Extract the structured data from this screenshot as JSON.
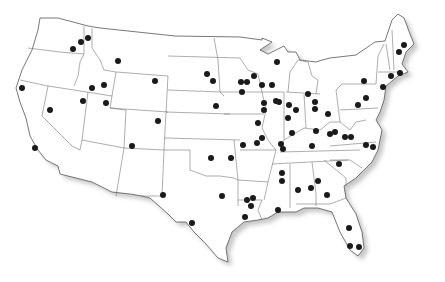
{
  "map": {
    "title": "United States locations map",
    "region": "Contiguous United States",
    "style": {
      "background": "#ffffff",
      "land_fill": "#ffffff",
      "border_color": "#6f6f6f",
      "shadow_color": "#9a9a9a",
      "marker_color": "#1a1a1a"
    },
    "marker_icon": "filled-circle-marker",
    "marker_count": 78,
    "markers": [
      {
        "region": "WA",
        "x": 73,
        "y": 49
      },
      {
        "region": "WA",
        "x": 81,
        "y": 42
      },
      {
        "region": "ID",
        "x": 88,
        "y": 38
      },
      {
        "region": "MT",
        "x": 118,
        "y": 61
      },
      {
        "region": "ID",
        "x": 92,
        "y": 88
      },
      {
        "region": "ID",
        "x": 104,
        "y": 85
      },
      {
        "region": "UT",
        "x": 83,
        "y": 101
      },
      {
        "region": "UT",
        "x": 106,
        "y": 103
      },
      {
        "region": "CA",
        "x": 22,
        "y": 88
      },
      {
        "region": "CA",
        "x": 35,
        "y": 148
      },
      {
        "region": "WY",
        "x": 155,
        "y": 81
      },
      {
        "region": "CO",
        "x": 132,
        "y": 146
      },
      {
        "region": "SD",
        "x": 207,
        "y": 74
      },
      {
        "region": "SD",
        "x": 213,
        "y": 81
      },
      {
        "region": "NE",
        "x": 216,
        "y": 106
      },
      {
        "region": "KS",
        "x": 158,
        "y": 121
      },
      {
        "region": "OK",
        "x": 211,
        "y": 158
      },
      {
        "region": "NM",
        "x": 163,
        "y": 195
      },
      {
        "region": "TX",
        "x": 192,
        "y": 223
      },
      {
        "region": "TX",
        "x": 222,
        "y": 196
      },
      {
        "region": "AR",
        "x": 253,
        "y": 198
      },
      {
        "region": "LA",
        "x": 251,
        "y": 206
      },
      {
        "region": "LA",
        "x": 245,
        "y": 217
      },
      {
        "region": "MN",
        "x": 241,
        "y": 82
      },
      {
        "region": "MN",
        "x": 247,
        "y": 82
      },
      {
        "region": "WI",
        "x": 254,
        "y": 76
      },
      {
        "region": "WI",
        "x": 262,
        "y": 85
      },
      {
        "region": "WI",
        "x": 272,
        "y": 85
      },
      {
        "region": "MI",
        "x": 277,
        "y": 62
      },
      {
        "region": "IA",
        "x": 242,
        "y": 92
      },
      {
        "region": "IL",
        "x": 264,
        "y": 103
      },
      {
        "region": "IL",
        "x": 264,
        "y": 110
      },
      {
        "region": "IL",
        "x": 276,
        "y": 101
      },
      {
        "region": "IL",
        "x": 279,
        "y": 102
      },
      {
        "region": "MO",
        "x": 258,
        "y": 123
      },
      {
        "region": "MO",
        "x": 243,
        "y": 145
      },
      {
        "region": "MO",
        "x": 257,
        "y": 143
      },
      {
        "region": "MO",
        "x": 262,
        "y": 138
      },
      {
        "region": "IN",
        "x": 289,
        "y": 105
      },
      {
        "region": "IN",
        "x": 296,
        "y": 110
      },
      {
        "region": "MI",
        "x": 308,
        "y": 94
      },
      {
        "region": "OH",
        "x": 315,
        "y": 102
      },
      {
        "region": "OH",
        "x": 315,
        "y": 109
      },
      {
        "region": "OH",
        "x": 328,
        "y": 114
      },
      {
        "region": "KY",
        "x": 292,
        "y": 133
      },
      {
        "region": "KY",
        "x": 281,
        "y": 144
      },
      {
        "region": "KY",
        "x": 283,
        "y": 149
      },
      {
        "region": "WV",
        "x": 335,
        "y": 132
      },
      {
        "region": "VA",
        "x": 345,
        "y": 137
      },
      {
        "region": "VA",
        "x": 351,
        "y": 137
      },
      {
        "region": "NY",
        "x": 364,
        "y": 81
      },
      {
        "region": "PA",
        "x": 366,
        "y": 98
      },
      {
        "region": "PA",
        "x": 358,
        "y": 105
      },
      {
        "region": "ME",
        "x": 404,
        "y": 45
      },
      {
        "region": "ME",
        "x": 399,
        "y": 52
      },
      {
        "region": "MA",
        "x": 400,
        "y": 73
      },
      {
        "region": "CT",
        "x": 391,
        "y": 76
      },
      {
        "region": "NY",
        "x": 383,
        "y": 87
      },
      {
        "region": "NC",
        "x": 366,
        "y": 145
      },
      {
        "region": "NC",
        "x": 373,
        "y": 147
      },
      {
        "region": "SC",
        "x": 339,
        "y": 164
      },
      {
        "region": "GA",
        "x": 318,
        "y": 181
      },
      {
        "region": "GA",
        "x": 311,
        "y": 188
      },
      {
        "region": "AL",
        "x": 298,
        "y": 190
      },
      {
        "region": "GA",
        "x": 327,
        "y": 195
      },
      {
        "region": "MS",
        "x": 282,
        "y": 173
      },
      {
        "region": "MS",
        "x": 282,
        "y": 181
      },
      {
        "region": "AL",
        "x": 278,
        "y": 210
      },
      {
        "region": "FL",
        "x": 349,
        "y": 228
      },
      {
        "region": "FL",
        "x": 350,
        "y": 246
      },
      {
        "region": "FL",
        "x": 359,
        "y": 247
      },
      {
        "region": "TN",
        "x": 316,
        "y": 131
      },
      {
        "region": "TN",
        "x": 330,
        "y": 134
      },
      {
        "region": "IN",
        "x": 288,
        "y": 118
      },
      {
        "region": "AR",
        "x": 231,
        "y": 158
      },
      {
        "region": "MS",
        "x": 247,
        "y": 200
      },
      {
        "region": "KY",
        "x": 312,
        "y": 146
      },
      {
        "region": "CA",
        "x": 50,
        "y": 110
      }
    ]
  }
}
